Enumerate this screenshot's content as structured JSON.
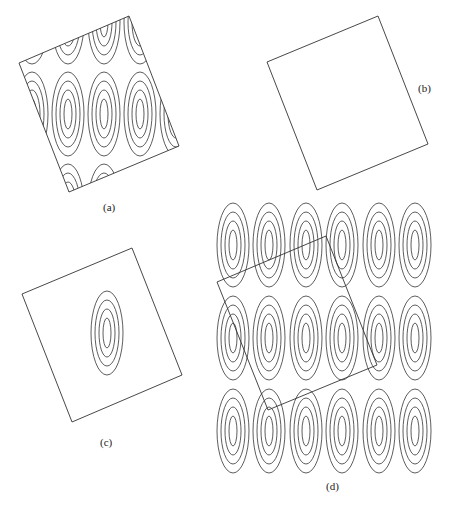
{
  "figure": {
    "panels": [
      {
        "id": "a",
        "label": "(a)",
        "description": "Rotated square window clipping a periodic lattice of elliptical contours"
      },
      {
        "id": "b",
        "label": "(b)",
        "description": "Empty rotated square window"
      },
      {
        "id": "c",
        "label": "(c)",
        "description": "Rotated square window containing a single set of elliptical contours"
      },
      {
        "id": "d",
        "label": "(d)",
        "description": "Rotated square overlaid on a 3x6 periodic lattice of elliptical contours"
      }
    ],
    "lattice": {
      "rows": 3,
      "cols": 6,
      "rings_per_cell": 4
    },
    "colors": {
      "stroke": "#333333",
      "background": "#ffffff"
    }
  }
}
